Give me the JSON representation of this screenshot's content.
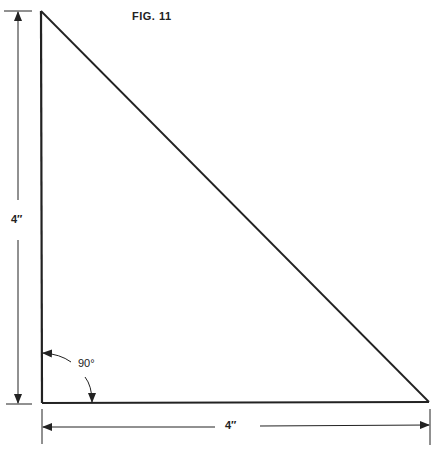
{
  "figure": {
    "title": "FIG. 11",
    "shape": "right-triangle",
    "vertical_dimension_label": "4″",
    "horizontal_dimension_label": "4″",
    "angle_label": "90°",
    "line_color": "#222222",
    "background_color": "#ffffff"
  }
}
